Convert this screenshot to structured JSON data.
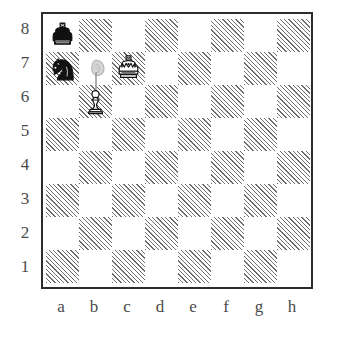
{
  "diagram": {
    "kind": "chess-board-diagram",
    "orientation": "white-bottom",
    "board": {
      "files": [
        "a",
        "b",
        "c",
        "d",
        "e",
        "f",
        "g",
        "h"
      ],
      "ranks": [
        "8",
        "7",
        "6",
        "5",
        "4",
        "3",
        "2",
        "1"
      ],
      "square_count": 64,
      "light_square_color": "#ffffff",
      "dark_square_color": "#6e6e6e",
      "dark_square_fill": "diagonal-hatch",
      "border_color": "#2c2c2c",
      "label_color": "#4a4a4a"
    },
    "pieces": [
      {
        "square": "a8",
        "color": "black",
        "type": "king",
        "glyph": "black-king-icon"
      },
      {
        "square": "a7",
        "color": "black",
        "type": "knight",
        "glyph": "black-knight-icon"
      },
      {
        "square": "c7",
        "color": "white",
        "type": "king",
        "glyph": "white-king-icon"
      },
      {
        "square": "b6",
        "color": "white",
        "type": "pawn",
        "glyph": "white-pawn-icon"
      }
    ],
    "annotations": [
      {
        "square": "b7",
        "color": "grey",
        "type": "knight",
        "glyph": "ghost-knight-icon",
        "style": "ghost",
        "meaning": "promotion-target"
      },
      {
        "kind": "promotion-stem",
        "from": "b6",
        "to": "b7",
        "color": "#9a9a9a"
      }
    ],
    "fen_position": "k7/n1K5/1P6/8/8/8/8/8"
  }
}
